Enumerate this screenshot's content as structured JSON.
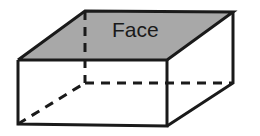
{
  "figure": {
    "name": "rectangular-prism-face-diagram",
    "background_color": "#ffffff"
  },
  "labels": {
    "face": "Face"
  },
  "colors": {
    "shaded_face_fill": "#a8a8a8",
    "unshaded_face_fill": "#ffffff",
    "edge_stroke": "#1a1a1a",
    "hidden_edge_stroke": "#1a1a1a",
    "label_text": "#1a1a1a"
  },
  "geometry": {
    "front_top_left": [
      18,
      60
    ],
    "front_top_right": [
      167,
      60
    ],
    "front_bottom_right": [
      167,
      126
    ],
    "front_bottom_left": [
      18,
      124
    ],
    "back_top_left": [
      85,
      11
    ],
    "back_top_right": [
      233,
      12
    ],
    "back_bottom_right": [
      233,
      83
    ],
    "back_bottom_left_hidden": [
      85,
      83
    ],
    "label_anchor": [
      112,
      31
    ]
  },
  "strokes": {
    "edge_width": 3,
    "hidden_edge_width": 3,
    "hidden_dash_pattern": "9 7"
  }
}
